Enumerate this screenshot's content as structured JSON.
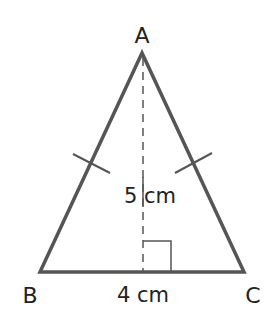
{
  "diagram": {
    "type": "isosceles-triangle",
    "vertices": {
      "A": {
        "label": "A",
        "x": 142,
        "y": 53
      },
      "B": {
        "label": "B",
        "x": 40,
        "y": 272
      },
      "C": {
        "label": "C",
        "x": 244,
        "y": 272
      }
    },
    "base_label": "4 cm",
    "height_label": "5 cm",
    "colors": {
      "stroke": "#555555",
      "text": "#222222",
      "background": "#ffffff"
    }
  }
}
